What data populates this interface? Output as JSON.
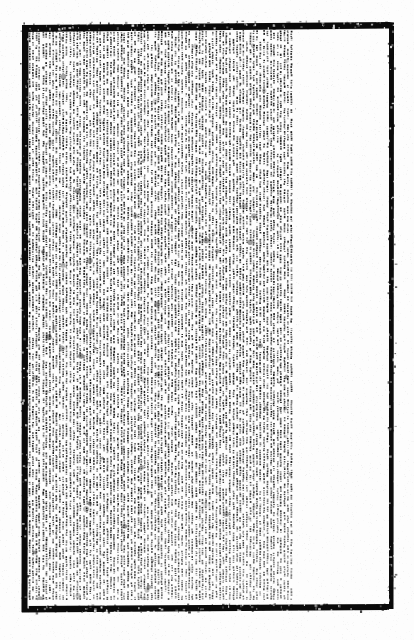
{
  "document": {
    "kind": "scanned-page",
    "medium": "monochrome bitonal scan",
    "orientation": "text rotated 90 degrees (vertical lines)",
    "legibility": "illegible at this resolution",
    "body_text": "",
    "caption": "",
    "page_number": "",
    "title": "",
    "heading": ""
  },
  "colors": {
    "paper": "#fdfdfd",
    "background": "#ffffff",
    "ink": "#111111",
    "border": "#0a0a0a",
    "grain": "#c8c8c8"
  },
  "frame": {
    "left": 22,
    "top": 25,
    "right": 389,
    "bottom": 606,
    "thickness": 5,
    "skew_top_px": 3,
    "skew_bottom_px": 2,
    "label": "printed rule border"
  },
  "text_block": {
    "left": 28,
    "top": 30,
    "right": 296,
    "bottom": 600,
    "width": 268,
    "height": 570,
    "line_direction": "vertical",
    "line_pitch_px": 3.4,
    "glyph_pitch_px": 2.1,
    "line_count": 79,
    "density": 0.62,
    "right_margin_blank_px": 93,
    "label": "dense body text"
  },
  "render_seed": 20240517
}
